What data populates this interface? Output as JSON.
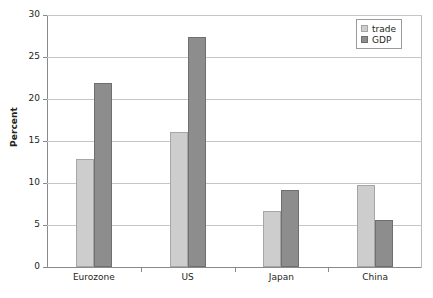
{
  "chart_data": {
    "type": "bar",
    "title": "",
    "xlabel": "",
    "ylabel": "Percent",
    "categories": [
      "Eurozone",
      "US",
      "Japan",
      "China"
    ],
    "series": [
      {
        "name": "trade",
        "color": "#cdcdcd",
        "values": [
          12.9,
          16.1,
          6.7,
          9.8
        ]
      },
      {
        "name": "GDP",
        "color": "#8d8d8d",
        "values": [
          21.9,
          27.4,
          9.2,
          5.6
        ]
      }
    ],
    "ylim": [
      0,
      30
    ],
    "ytick_step": 5,
    "yticks": [
      "0",
      "5",
      "10",
      "15",
      "20",
      "25",
      "30"
    ],
    "grid": true,
    "legend_position": "top-right"
  },
  "legend": {
    "items": [
      {
        "label": "trade"
      },
      {
        "label": "GDP"
      }
    ]
  }
}
